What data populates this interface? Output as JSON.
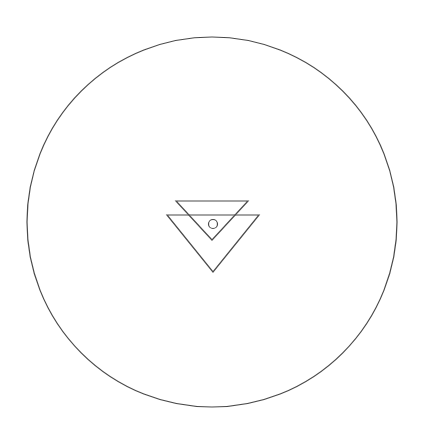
{
  "canvas": {
    "width": 426,
    "height": 447,
    "background_color": "#ffffff",
    "title": "Line art diagram: circle enclosing two inverted triangles"
  },
  "style": {
    "stroke_color": "#4a4a4a",
    "fill": "none",
    "outer_circle_stroke_width": 1.2,
    "triangle_stroke_width": 1.2,
    "inner_circle_stroke_width": 1.2
  },
  "shapes": {
    "outer_circle": {
      "name": "outer-circle",
      "type": "circle",
      "cx": 212,
      "cy": 222,
      "r": 185
    },
    "upper_triangle": {
      "name": "upper-triangle",
      "type": "polygon",
      "orientation": "pointing-down",
      "points": "176,201 248,201 212,240"
    },
    "lower_triangle": {
      "name": "lower-triangle",
      "type": "polygon",
      "orientation": "pointing-down",
      "points": "167,215 259,215 213,272"
    },
    "inner_circle": {
      "name": "inner-circle",
      "type": "circle",
      "cx": 213,
      "cy": 224,
      "r": 4.5
    }
  }
}
